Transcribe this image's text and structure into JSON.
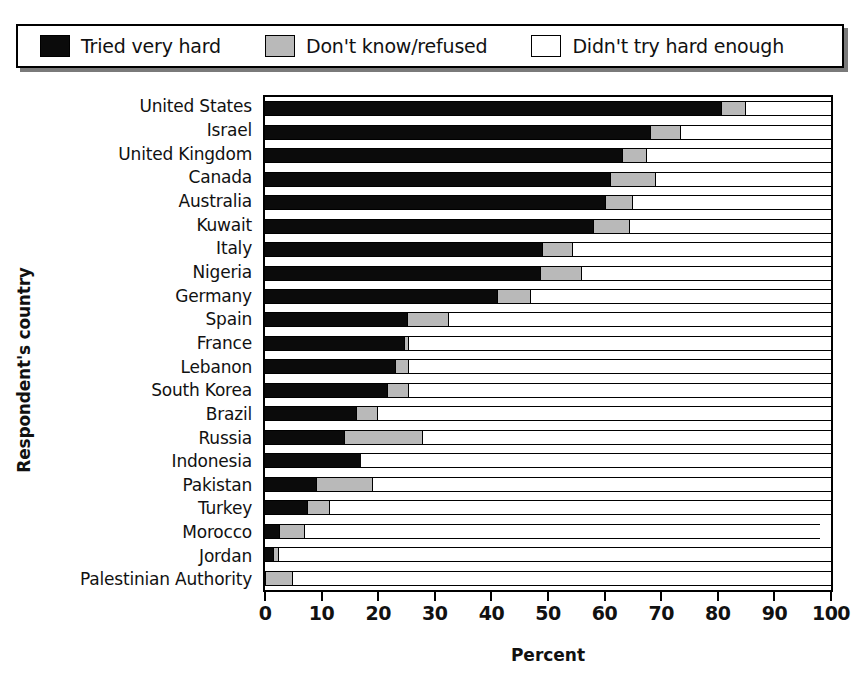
{
  "legend": {
    "items": [
      {
        "label": "Tried very hard",
        "swatch": "black-swatch-icon",
        "color": "#0b0b0b"
      },
      {
        "label": "Don't know/refused",
        "swatch": "gray-swatch-icon",
        "color": "#b9b9b9"
      },
      {
        "label": "Didn't try hard enough",
        "swatch": "white-swatch-icon",
        "color": "#ffffff"
      }
    ]
  },
  "axes": {
    "ylabel": "Respondent's country",
    "xlabel": "Percent",
    "xticks": [
      0,
      10,
      20,
      30,
      40,
      50,
      60,
      70,
      80,
      90,
      100
    ]
  },
  "chart_data": {
    "type": "bar",
    "orientation": "horizontal",
    "stacked": true,
    "title": "",
    "xlabel": "Percent",
    "ylabel": "Respondent's country",
    "xlim": [
      0,
      100
    ],
    "grid": false,
    "legend_position": "top",
    "categories": [
      "United States",
      "Israel",
      "United Kingdom",
      "Canada",
      "Australia",
      "Kuwait",
      "Italy",
      "Nigeria",
      "Germany",
      "Spain",
      "France",
      "Lebanon",
      "South Korea",
      "Brazil",
      "Russia",
      "Indonesia",
      "Pakistan",
      "Turkey",
      "Morocco",
      "Jordan",
      "Palestinian Authority"
    ],
    "series": [
      {
        "name": "Tried very hard",
        "color": "#0b0b0b",
        "values": [
          80.5,
          68,
          63,
          61,
          60,
          58,
          49,
          48.5,
          41,
          25,
          24.5,
          23,
          21.5,
          16,
          14,
          17,
          9,
          7.5,
          2.5,
          1.5,
          0
        ]
      },
      {
        "name": "Don't know/refused",
        "color": "#b9b9b9",
        "values": [
          4.5,
          5.5,
          4.5,
          8,
          5,
          6.5,
          5.5,
          7.5,
          6,
          7.5,
          1,
          2.5,
          4,
          4,
          14,
          0,
          10,
          4,
          4.5,
          1,
          5
        ]
      },
      {
        "name": "Didn't try hard enough",
        "color": "#ffffff",
        "values": [
          15,
          26.5,
          32.5,
          31,
          35,
          35.5,
          45.5,
          44,
          53,
          67.5,
          74.5,
          74.5,
          74.5,
          80,
          72,
          83,
          81,
          88.5,
          91,
          97.5,
          95
        ]
      }
    ]
  }
}
